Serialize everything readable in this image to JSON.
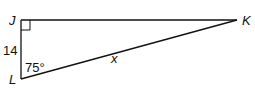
{
  "diagram": {
    "type": "right-triangle",
    "vertices": {
      "J": {
        "label": "J",
        "x": 21,
        "y": 20
      },
      "K": {
        "label": "K",
        "x": 237,
        "y": 20
      },
      "L": {
        "label": "L",
        "x": 21,
        "y": 79
      }
    },
    "right_angle_at": "J",
    "side_JL": {
      "label": "14"
    },
    "side_LK": {
      "label": "x"
    },
    "angle_L": {
      "label": "75°"
    },
    "stroke_color": "#111111"
  }
}
